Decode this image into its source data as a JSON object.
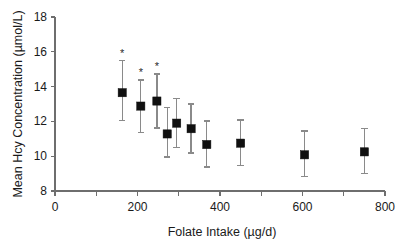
{
  "chart_data": {
    "type": "scatter",
    "title": "",
    "xlabel": "Folate Intake (µg/d)",
    "ylabel": "Mean Hcy Concentration (µmol/L)",
    "xlim": [
      0,
      800
    ],
    "ylim": [
      8,
      18
    ],
    "xticks": [
      0,
      200,
      400,
      600,
      800
    ],
    "xticklabels": [
      "0",
      "200",
      "400",
      "600",
      "800"
    ],
    "xminorticks": [
      100,
      300,
      500,
      700
    ],
    "yticks": [
      8,
      10,
      12,
      14,
      16,
      18
    ],
    "yticklabels": [
      "8",
      "10",
      "12",
      "14",
      "16",
      "18"
    ],
    "grid": false,
    "legend": "none",
    "marker_style": "filled-square",
    "error_bars": "vertical",
    "significance_symbol": "*",
    "series": [
      {
        "name": "Mean Hcy Concentration",
        "x": [
          163,
          208,
          247,
          272,
          295,
          330,
          368,
          450,
          605,
          750
        ],
        "values": [
          13.65,
          12.88,
          13.17,
          11.28,
          11.9,
          11.58,
          10.67,
          10.75,
          10.08,
          10.25
        ],
        "err_low": [
          12.05,
          11.35,
          11.62,
          9.95,
          10.48,
          10.18,
          9.38,
          9.45,
          8.82,
          9.0
        ],
        "err_high": [
          15.48,
          14.38,
          14.72,
          12.78,
          13.32,
          13.0,
          12.02,
          12.08,
          11.45,
          11.6
        ],
        "significant": [
          true,
          true,
          true,
          false,
          false,
          false,
          false,
          false,
          false,
          false
        ]
      }
    ]
  }
}
